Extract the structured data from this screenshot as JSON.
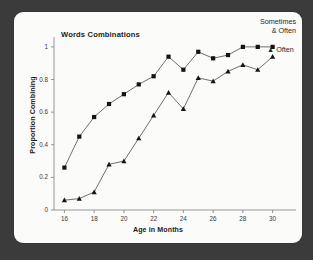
{
  "figure": {
    "background_color": "#3b3b3b",
    "panel_color": "#fbfbfa",
    "line_color": "#4a4a4a",
    "marker_color": "#141414"
  },
  "chart_data": {
    "type": "line",
    "title": "Words Combinations",
    "xlabel": "Age in Months",
    "ylabel": "Proportion Combining",
    "xlim": [
      15.3,
      30.9
    ],
    "ylim": [
      0,
      1.03
    ],
    "grid": false,
    "legend_position": "top-right",
    "x": [
      16,
      17,
      18,
      19,
      20,
      21,
      22,
      23,
      24,
      25,
      26,
      27,
      28,
      29,
      30
    ],
    "xticks": [
      16,
      18,
      20,
      22,
      24,
      26,
      28,
      30
    ],
    "xtick_labels": [
      "16",
      "18",
      "20",
      "22",
      "24",
      "26",
      "28",
      "30"
    ],
    "yticks": [
      0,
      0.2,
      0.4,
      0.6,
      0.8,
      1
    ],
    "ytick_labels": [
      "0",
      "0.2",
      "0.4",
      "0.6",
      "0.8",
      "1"
    ],
    "series": [
      {
        "name": "Sometimes & Often",
        "marker": "square",
        "legend_line_1": "Sometimes",
        "legend_line_2": "& Often",
        "values": [
          0.26,
          0.45,
          0.57,
          0.65,
          0.71,
          0.77,
          0.82,
          0.94,
          0.86,
          0.97,
          0.93,
          0.95,
          1.0,
          1.0,
          1.0
        ]
      },
      {
        "name": "Often",
        "marker": "triangle",
        "legend_line_1": "Often",
        "values": [
          0.06,
          0.07,
          0.11,
          0.28,
          0.3,
          0.44,
          0.58,
          0.72,
          0.62,
          0.81,
          0.79,
          0.85,
          0.89,
          0.86,
          0.94
        ]
      }
    ]
  }
}
